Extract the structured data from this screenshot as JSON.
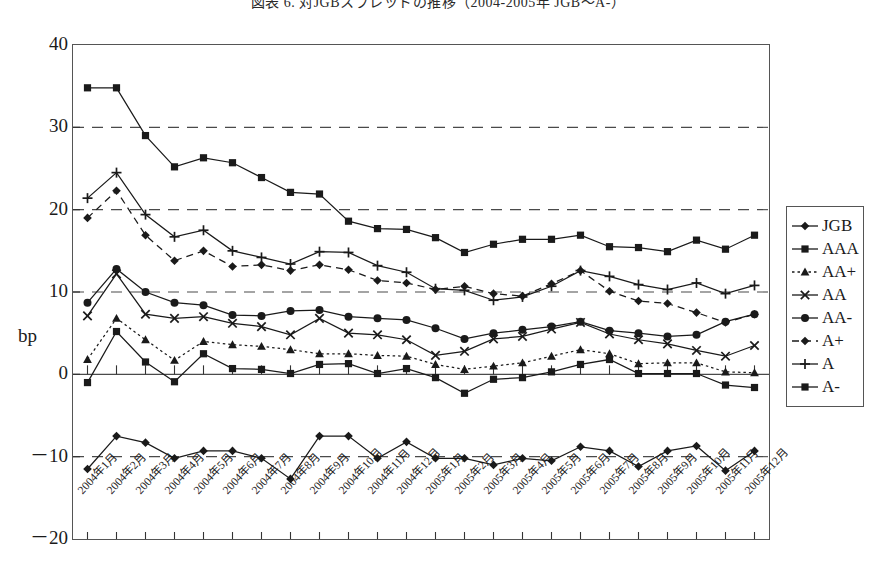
{
  "title": "図表 6.  対JGBスプレッドの推移（2004-2005年 JGB〜A-）",
  "axis": {
    "y_title": "bp",
    "y_ticks": [
      "40",
      "30",
      "20",
      "10",
      "0",
      "－10",
      "－20"
    ],
    "y_values": [
      40,
      30,
      20,
      10,
      0,
      -10,
      -20
    ]
  },
  "legend": {
    "items": [
      {
        "label": "JGB",
        "marker": "diamond",
        "dash": "solid",
        "color": "#1a1a1a"
      },
      {
        "label": "AAA",
        "marker": "square",
        "dash": "solid",
        "color": "#1a1a1a"
      },
      {
        "label": "AA+",
        "marker": "triangle",
        "dash": "dotted",
        "color": "#1a1a1a"
      },
      {
        "label": "AA",
        "marker": "cross",
        "dash": "solid",
        "color": "#1a1a1a"
      },
      {
        "label": "AA-",
        "marker": "circle",
        "dash": "solid",
        "color": "#1a1a1a"
      },
      {
        "label": "A+",
        "marker": "diamond",
        "dash": "dashed",
        "color": "#1a1a1a"
      },
      {
        "label": "A",
        "marker": "plus",
        "dash": "solid",
        "color": "#1a1a1a"
      },
      {
        "label": "A-",
        "marker": "square",
        "dash": "solid",
        "color": "#1a1a1a"
      }
    ]
  },
  "chart_data": {
    "type": "line",
    "title": "図表 6.  対JGBスプレッドの推移（2004-2005年 JGB〜A-）",
    "xlabel": "",
    "ylabel": "bp",
    "ylim": [
      -20,
      40
    ],
    "ytick_step": 10,
    "grid": "horizontal dashed at 30, 20, 10, 0, -10",
    "legend_position": "right",
    "categories": [
      "2004年1月",
      "2004年2月",
      "2004年3月",
      "2004年4月",
      "2004年5月",
      "2004年6月",
      "2004年7月",
      "2004年8月",
      "2004年9月",
      "2004年10月",
      "2004年11月",
      "2004年12月",
      "2005年1月",
      "2005年2月",
      "2005年3月",
      "2005年4月",
      "2005年5月",
      "2005年6月",
      "2005年7月",
      "2005年8月",
      "2005年9月",
      "2005年10月",
      "2005年11月",
      "2005年12月"
    ],
    "series": [
      {
        "name": "JGB",
        "marker": "diamond",
        "dash": "solid",
        "values": [
          -11.5,
          -7.5,
          -8.3,
          -10.2,
          -9.3,
          -9.3,
          -10.2,
          -12.7,
          -7.5,
          -7.5,
          -10.2,
          -8.2,
          -10.2,
          -10.2,
          -11.0,
          -10.2,
          -10.5,
          -8.8,
          -9.3,
          -11.2,
          -9.3,
          -8.7,
          -11.7,
          -9.3
        ]
      },
      {
        "name": "AAA",
        "marker": "square",
        "dash": "solid",
        "values": [
          -1.0,
          5.2,
          1.5,
          -0.9,
          2.5,
          0.7,
          0.6,
          0.1,
          1.2,
          1.3,
          0.1,
          0.7,
          -0.4,
          -2.3,
          -0.6,
          -0.4,
          0.3,
          1.2,
          1.8,
          0.1,
          0.1,
          0.1,
          -1.3,
          -1.6
        ]
      },
      {
        "name": "AA+",
        "marker": "triangle",
        "dash": "dotted",
        "values": [
          1.8,
          6.8,
          4.2,
          1.7,
          4.0,
          3.6,
          3.4,
          3.0,
          2.5,
          2.5,
          2.3,
          2.2,
          1.2,
          0.6,
          1.0,
          1.4,
          2.2,
          3.0,
          2.5,
          1.3,
          1.4,
          1.4,
          0.3,
          0.2
        ]
      },
      {
        "name": "AA",
        "marker": "cross",
        "dash": "solid",
        "values": [
          7.1,
          12.2,
          7.3,
          6.8,
          7.0,
          6.2,
          5.8,
          4.8,
          6.8,
          5.0,
          4.8,
          4.2,
          2.3,
          2.8,
          4.3,
          4.6,
          5.5,
          6.3,
          4.9,
          4.2,
          3.7,
          2.9,
          2.2,
          3.5
        ]
      },
      {
        "name": "AA-",
        "marker": "circle",
        "dash": "solid",
        "values": [
          8.7,
          12.8,
          10.0,
          8.7,
          8.4,
          7.2,
          7.1,
          7.7,
          7.8,
          7.0,
          6.8,
          6.6,
          5.6,
          4.3,
          5.0,
          5.4,
          5.8,
          6.4,
          5.3,
          5.0,
          4.6,
          4.8,
          6.4,
          7.3
        ]
      },
      {
        "name": "A+",
        "marker": "diamond",
        "dash": "dashed",
        "values": [
          19.0,
          22.3,
          16.9,
          13.8,
          15.0,
          13.1,
          13.3,
          12.6,
          13.3,
          12.7,
          11.4,
          11.1,
          10.3,
          10.7,
          9.8,
          9.5,
          11.0,
          12.6,
          10.1,
          8.9,
          8.6,
          7.5,
          6.3,
          7.3
        ]
      },
      {
        "name": "A",
        "marker": "plus",
        "dash": "solid",
        "values": [
          21.4,
          24.5,
          19.4,
          16.7,
          17.5,
          15.0,
          14.2,
          13.4,
          14.9,
          14.8,
          13.2,
          12.4,
          10.4,
          10.2,
          9.0,
          9.4,
          10.7,
          12.6,
          11.9,
          10.9,
          10.3,
          11.1,
          9.8,
          10.8
        ]
      },
      {
        "name": "A-",
        "marker": "square",
        "dash": "solid",
        "values": [
          34.8,
          34.8,
          29.0,
          25.2,
          26.3,
          25.7,
          23.9,
          22.1,
          21.9,
          18.6,
          17.7,
          17.6,
          16.6,
          14.8,
          15.8,
          16.4,
          16.4,
          16.9,
          15.5,
          15.4,
          14.9,
          16.3,
          15.2,
          16.9
        ]
      }
    ]
  }
}
